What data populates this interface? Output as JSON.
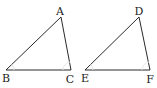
{
  "diagram": {
    "type": "two-triangles",
    "triangles": [
      {
        "name": "ABC",
        "vertices": [
          {
            "label": "A",
            "x": 61,
            "y": 17,
            "lx": 60,
            "ly": 15
          },
          {
            "label": "B",
            "x": 6,
            "y": 70,
            "lx": 6,
            "ly": 82
          },
          {
            "label": "C",
            "x": 71,
            "y": 70,
            "lx": 70,
            "ly": 83
          }
        ]
      },
      {
        "name": "DEF",
        "vertices": [
          {
            "label": "D",
            "x": 139,
            "y": 17,
            "lx": 139,
            "ly": 15
          },
          {
            "label": "E",
            "x": 85,
            "y": 70,
            "lx": 85,
            "ly": 82
          },
          {
            "label": "F",
            "x": 150,
            "y": 70,
            "lx": 150,
            "ly": 83
          }
        ]
      }
    ],
    "colors": {
      "edge": "#2a2a2a",
      "label": "#222222",
      "arc": "#e6e6e6"
    }
  }
}
